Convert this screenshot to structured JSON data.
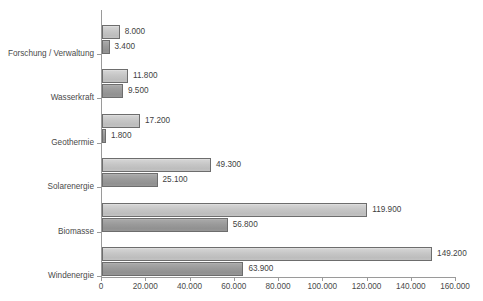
{
  "chart_data": {
    "type": "bar",
    "orientation": "horizontal",
    "title": "",
    "subtitle": "",
    "xlabel": "",
    "ylabel": "",
    "grid": false,
    "legend": "none",
    "xlim": [
      0,
      160000
    ],
    "xticks": [
      0,
      20000,
      40000,
      60000,
      80000,
      100000,
      120000,
      140000,
      160000
    ],
    "xtick_labels": [
      "0",
      "20.000",
      "40.000",
      "60.000",
      "80.000",
      "100.000",
      "120.000",
      "140.000",
      "160.000"
    ],
    "categories": [
      "Forschung / Verwaltung",
      "Wasserkraft",
      "Geothermie",
      "Solarenergie",
      "Biomasse",
      "Windenergie"
    ],
    "series": [
      {
        "name": "series-a",
        "color": "#c6c6c6",
        "values": [
          8000,
          11800,
          17200,
          49300,
          119900,
          149200
        ],
        "value_labels": [
          "8.000",
          "11.800",
          "17.200",
          "49.300",
          "119.900",
          "149.200"
        ]
      },
      {
        "name": "series-b",
        "color": "#9a9a9a",
        "values": [
          3400,
          9500,
          1800,
          25100,
          56800,
          63900
        ],
        "value_labels": [
          "3.400",
          "9.500",
          "1.800",
          "25.100",
          "56.800",
          "63.900"
        ]
      }
    ],
    "axis_color": "#9a9a9a",
    "bar_border_color": "#6d6d6d",
    "text_color": "#4a4a4a",
    "background": "#ffffff"
  }
}
